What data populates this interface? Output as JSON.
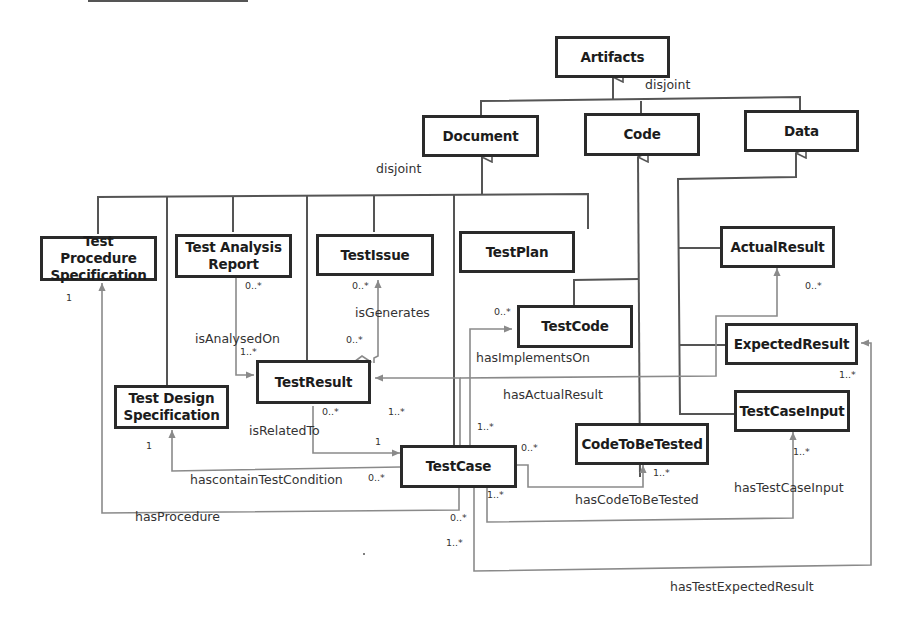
{
  "diagram": {
    "type": "UML class diagram",
    "classes": {
      "artifacts": "Artifacts",
      "document": "Document",
      "code": "Code",
      "data": "Data",
      "test_procedure_spec": "Test Procedure Specification",
      "test_analysis_report": "Test Analysis Report",
      "test_issue": "TestIssue",
      "test_plan": "TestPlan",
      "actual_result": "ActualResult",
      "test_code": "TestCode",
      "expected_result": "ExpectedResult",
      "test_result": "TestResult",
      "test_design_spec": "Test Design Specification",
      "test_case_input": "TestCaseInput",
      "code_to_be_tested": "CodeToBeTested",
      "test_case": "TestCase"
    },
    "constraints": {
      "artifacts_disjoint": "disjoint",
      "document_disjoint": "disjoint"
    },
    "associations": {
      "is_analysed_on": "isAnalysedOn",
      "is_generates": "isGenerates",
      "has_implements_on": "hasImplementsOn",
      "has_actual_result": "hasActualResult",
      "is_related_to": "isRelatedTo",
      "has_contain_test_condition": "hascontainTestCondition",
      "has_procedure": "hasProcedure",
      "has_code_to_be_tested": "hasCodeToBeTested",
      "has_test_case_input": "hasTestCaseInput",
      "has_test_expected_result": "hasTestExpectedResult"
    },
    "multiplicities": {
      "tps_1": "1",
      "tar_0n": "0..*",
      "tr_analysed_1n": "1..*",
      "ti_0n": "0..*",
      "tr_gen_0n": "0..*",
      "tc_code_0n": "0..*",
      "ar_0n": "0..*",
      "er_1n": "1..*",
      "tr_rel_0n": "0..*",
      "tr_actual_1n": "1..*",
      "tc_rel_1": "1",
      "tds_1": "1",
      "tc_cond_0n": "0..*",
      "tc_impl_1n": "1..*",
      "tc_ctbt_0n": "0..*",
      "ctbt_1n": "1..*",
      "tc_input_1n": "1..*",
      "tci_1n": "1..*",
      "tc_proc_0n": "0..*",
      "tc_exp_1n": "1..*"
    },
    "colors": {
      "class_border": "#2a2a2a",
      "generalization_line": "#555555",
      "association_line": "#8a8a8a",
      "background": "#ffffff"
    }
  }
}
